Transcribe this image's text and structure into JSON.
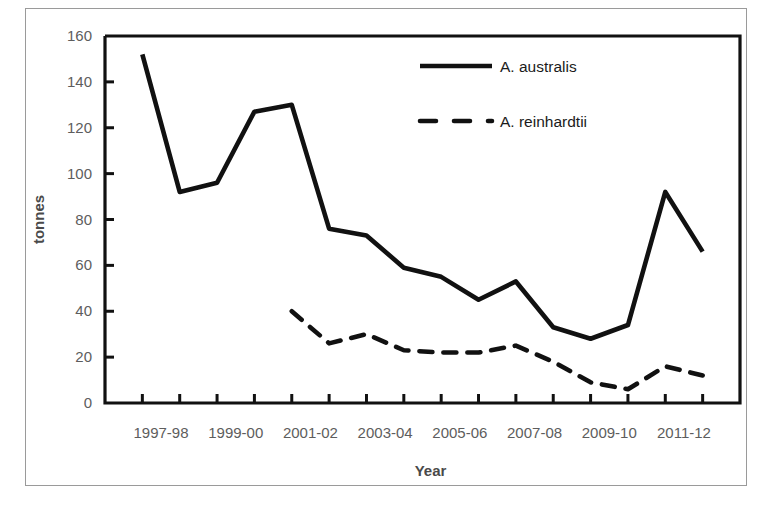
{
  "figure": {
    "background_color": "#ffffff",
    "frame_color": "#9a9a9a",
    "line_color": "#111111",
    "tick_label_color": "#5d5d5d",
    "axis_title_color": "#4a4a4a"
  },
  "axes": {
    "y_title": "tonnes",
    "x_title": "Year",
    "y_ticks": [
      "0",
      "20",
      "40",
      "60",
      "80",
      "100",
      "120",
      "140",
      "160"
    ],
    "x_ticks": [
      "1997-98",
      "1999-00",
      "2001-02",
      "2003-04",
      "2005-06",
      "2007-08",
      "2009-10",
      "2011-12"
    ]
  },
  "legend": {
    "items": [
      {
        "label": "A. australis",
        "style": "solid"
      },
      {
        "label": "A. reinhardtii",
        "style": "dashed"
      }
    ]
  },
  "caption": {
    "text": ""
  },
  "chart_data": {
    "type": "line",
    "title": "",
    "xlabel": "Year",
    "ylabel": "tonnes",
    "ylim": [
      0,
      160
    ],
    "ytick_step": 20,
    "grid": false,
    "legend_position": "top-right",
    "categories": [
      "1997-98",
      "1998-99",
      "1999-00",
      "2000-01",
      "2001-02",
      "2002-03",
      "2003-04",
      "2004-05",
      "2005-06",
      "2006-07",
      "2007-08",
      "2008-09",
      "2009-10",
      "2010-11",
      "2011-12",
      "2012-13"
    ],
    "series": [
      {
        "name": "A. australis",
        "style": "solid",
        "values": [
          152,
          92,
          96,
          127,
          130,
          76,
          73,
          59,
          55,
          45,
          53,
          33,
          28,
          34,
          92,
          66
        ]
      },
      {
        "name": "A. reinhardtii",
        "style": "dashed",
        "values": [
          null,
          null,
          null,
          null,
          40,
          26,
          30,
          23,
          22,
          22,
          25,
          18,
          9,
          6,
          16,
          12
        ]
      }
    ]
  }
}
